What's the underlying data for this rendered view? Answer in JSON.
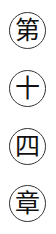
{
  "title_vertical": {
    "characters": [
      "第",
      "十",
      "四",
      "章"
    ]
  }
}
